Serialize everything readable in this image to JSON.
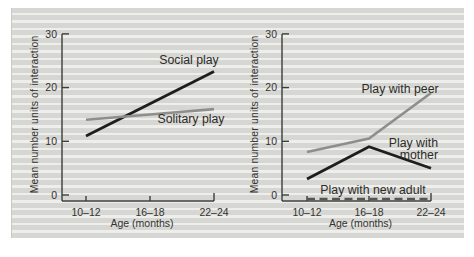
{
  "colors": {
    "page_background": "#ffffff",
    "stripe_dark": "#d6d6d3",
    "stripe_light": "#eeeeec",
    "axis": "#3c3c39",
    "text": "#33332f",
    "line_black": "#1e1e1c",
    "line_gray": "#8e8e8c",
    "line_dashed": "#565654"
  },
  "chart_data": [
    {
      "type": "line",
      "title": "",
      "xlabel": "Age (months)",
      "ylabel": "Mean number units of interaction",
      "categories": [
        "10–12",
        "16–18",
        "22–24"
      ],
      "yticks": [
        0,
        10,
        20,
        30
      ],
      "ylim": [
        0,
        30
      ],
      "grid": false,
      "legend": "inline-labels",
      "series": [
        {
          "name": "Social play",
          "values": [
            11,
            17,
            23
          ],
          "color": "#1e1e1c",
          "style": "solid"
        },
        {
          "name": "Solitary play",
          "values": [
            14,
            15,
            16
          ],
          "color": "#8e8e8c",
          "style": "solid"
        }
      ]
    },
    {
      "type": "line",
      "title": "",
      "xlabel": "Age (months)",
      "ylabel": "Mean number units of interaction",
      "categories": [
        "10–12",
        "16–18",
        "22–24"
      ],
      "yticks": [
        0,
        10,
        20,
        30
      ],
      "ylim": [
        0,
        30
      ],
      "grid": false,
      "legend": "inline-labels",
      "series": [
        {
          "name": "Play with peer",
          "values": [
            8,
            10.5,
            19
          ],
          "color": "#8e8e8c",
          "style": "solid"
        },
        {
          "name": "Play with mother",
          "values": [
            3,
            9,
            5
          ],
          "color": "#1e1e1c",
          "style": "solid"
        },
        {
          "name": "Play with new adult",
          "values": [
            0,
            0,
            0
          ],
          "color": "#565654",
          "style": "dashed"
        }
      ]
    }
  ]
}
